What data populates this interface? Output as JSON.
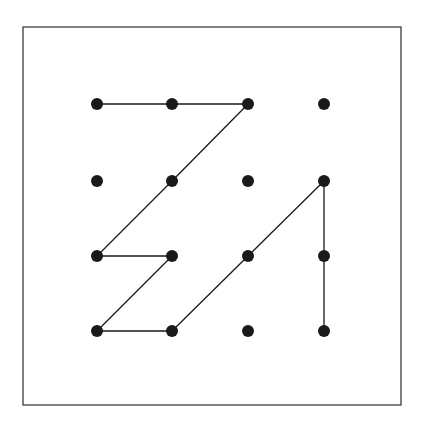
{
  "diagram": {
    "type": "dot-grid-path",
    "colors": {
      "background": "#ffffff",
      "frame": "#555555",
      "dot": "#1a1a1a",
      "line": "#1a1a1a"
    },
    "frame": {
      "x": 23,
      "y": 27,
      "width": 378,
      "height": 378
    },
    "grid": {
      "rows": 4,
      "cols": 4,
      "x_positions": [
        97,
        172,
        248,
        324
      ],
      "y_positions": [
        104,
        181,
        256,
        331
      ],
      "dot_radius": 6
    },
    "path": [
      [
        0,
        0
      ],
      [
        1,
        0
      ],
      [
        2,
        0
      ],
      [
        1,
        1
      ],
      [
        0,
        2
      ],
      [
        1,
        2
      ],
      [
        0,
        3
      ],
      [
        1,
        3
      ],
      [
        2,
        2
      ],
      [
        3,
        1
      ],
      [
        3,
        2
      ],
      [
        3,
        3
      ]
    ]
  }
}
